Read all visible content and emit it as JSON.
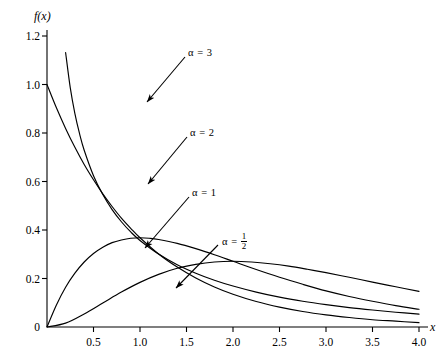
{
  "chart_data": {
    "type": "line",
    "title": "",
    "xlabel": "x",
    "ylabel": "f(x)",
    "xlim": [
      0,
      4.15
    ],
    "ylim": [
      0,
      1.26
    ],
    "grid": false,
    "legend_position": "inline-annotations",
    "x_ticks": [
      "0.5",
      "1.0",
      "1.5",
      "2.0",
      "2.5",
      "3.0",
      "3.5",
      "4.0"
    ],
    "x_tick_values": [
      0.5,
      1.0,
      1.5,
      2.0,
      2.5,
      3.0,
      3.5,
      4.0
    ],
    "y_ticks": [
      "0",
      "0.2",
      "0.4",
      "0.6",
      "0.8",
      "1.0",
      "1.2"
    ],
    "y_tick_values": [
      0,
      0.2,
      0.4,
      0.6,
      0.8,
      1.0,
      1.2
    ],
    "origin_label": "0",
    "series": [
      {
        "name": "alpha-one-half",
        "label_prefix": "α =",
        "label_value": "1/2",
        "alpha": 0.5,
        "formula": "f(x) = x^(-1/2) e^(-x) / sqrt(pi)",
        "peak": {
          "x": 0.0,
          "y": null
        },
        "points": [
          [
            0.02,
            3.974
          ],
          [
            0.04,
            2.765
          ],
          [
            0.06,
            2.227
          ],
          [
            0.08,
            1.907
          ],
          [
            0.1,
            1.687
          ],
          [
            0.13,
            1.461
          ],
          [
            0.16,
            1.297
          ],
          [
            0.2,
            1.132
          ],
          [
            0.25,
            0.987
          ],
          [
            0.3,
            0.88
          ],
          [
            0.35,
            0.797
          ],
          [
            0.4,
            0.729
          ],
          [
            0.5,
            0.624
          ],
          [
            0.6,
            0.546
          ],
          [
            0.7,
            0.484
          ],
          [
            0.8,
            0.434
          ],
          [
            0.9,
            0.392
          ],
          [
            1.0,
            0.357
          ],
          [
            1.2,
            0.301
          ],
          [
            1.4,
            0.257
          ],
          [
            1.6,
            0.222
          ],
          [
            1.8,
            0.193
          ],
          [
            2.0,
            0.169
          ],
          [
            2.25,
            0.144
          ],
          [
            2.5,
            0.123
          ],
          [
            2.75,
            0.106
          ],
          [
            3.0,
            0.092
          ],
          [
            3.25,
            0.08
          ],
          [
            3.5,
            0.07
          ],
          [
            3.75,
            0.061
          ],
          [
            4.0,
            0.053
          ]
        ]
      },
      {
        "name": "alpha-1",
        "label_prefix": "α =",
        "label_value": "1",
        "alpha": 1,
        "formula": "f(x) = e^(-x)",
        "peak": {
          "x": 0.0,
          "y": 1.0
        },
        "points": [
          [
            0.0,
            1.0
          ],
          [
            0.1,
            0.905
          ],
          [
            0.2,
            0.819
          ],
          [
            0.3,
            0.741
          ],
          [
            0.4,
            0.67
          ],
          [
            0.5,
            0.607
          ],
          [
            0.6,
            0.549
          ],
          [
            0.7,
            0.497
          ],
          [
            0.8,
            0.449
          ],
          [
            0.9,
            0.407
          ],
          [
            1.0,
            0.368
          ],
          [
            1.2,
            0.301
          ],
          [
            1.4,
            0.247
          ],
          [
            1.6,
            0.202
          ],
          [
            1.8,
            0.165
          ],
          [
            2.0,
            0.135
          ],
          [
            2.25,
            0.105
          ],
          [
            2.5,
            0.082
          ],
          [
            2.75,
            0.064
          ],
          [
            3.0,
            0.05
          ],
          [
            3.25,
            0.039
          ],
          [
            3.5,
            0.03
          ],
          [
            3.75,
            0.024
          ],
          [
            4.0,
            0.018
          ]
        ]
      },
      {
        "name": "alpha-2",
        "label_prefix": "α =",
        "label_value": "2",
        "alpha": 2,
        "formula": "f(x) = x e^(-x)",
        "peak": {
          "x": 1.0,
          "y": 0.368
        },
        "points": [
          [
            0.0,
            0.0
          ],
          [
            0.1,
            0.09
          ],
          [
            0.2,
            0.164
          ],
          [
            0.3,
            0.222
          ],
          [
            0.4,
            0.268
          ],
          [
            0.5,
            0.303
          ],
          [
            0.6,
            0.329
          ],
          [
            0.7,
            0.348
          ],
          [
            0.8,
            0.359
          ],
          [
            0.9,
            0.366
          ],
          [
            1.0,
            0.368
          ],
          [
            1.1,
            0.366
          ],
          [
            1.2,
            0.361
          ],
          [
            1.4,
            0.345
          ],
          [
            1.6,
            0.323
          ],
          [
            1.8,
            0.298
          ],
          [
            2.0,
            0.271
          ],
          [
            2.25,
            0.237
          ],
          [
            2.5,
            0.205
          ],
          [
            2.75,
            0.176
          ],
          [
            3.0,
            0.149
          ],
          [
            3.25,
            0.126
          ],
          [
            3.5,
            0.106
          ],
          [
            3.75,
            0.088
          ],
          [
            4.0,
            0.073
          ]
        ]
      },
      {
        "name": "alpha-3",
        "label_prefix": "α =",
        "label_value": "3",
        "alpha": 3,
        "formula": "f(x) = x^2 e^(-x) / 2",
        "peak": {
          "x": 2.0,
          "y": 0.271
        },
        "points": [
          [
            0.0,
            0.0
          ],
          [
            0.2,
            0.016
          ],
          [
            0.4,
            0.054
          ],
          [
            0.6,
            0.099
          ],
          [
            0.8,
            0.144
          ],
          [
            1.0,
            0.184
          ],
          [
            1.2,
            0.217
          ],
          [
            1.4,
            0.242
          ],
          [
            1.6,
            0.258
          ],
          [
            1.8,
            0.268
          ],
          [
            2.0,
            0.271
          ],
          [
            2.2,
            0.268
          ],
          [
            2.4,
            0.261
          ],
          [
            2.6,
            0.251
          ],
          [
            2.8,
            0.238
          ],
          [
            3.0,
            0.224
          ],
          [
            3.25,
            0.205
          ],
          [
            3.5,
            0.185
          ],
          [
            3.75,
            0.166
          ],
          [
            4.0,
            0.147
          ]
        ]
      }
    ],
    "annotations": [
      {
        "name": "alpha-3-annotation",
        "text_prefix": "α =",
        "text_value": "3",
        "fraction": false,
        "label_x": 188,
        "label_y": 47,
        "arrow_from_x": 185,
        "arrow_from_y": 57,
        "arrow_to_x": 147,
        "arrow_to_y": 102
      },
      {
        "name": "alpha-2-annotation",
        "text_prefix": "α =",
        "text_value": "2",
        "fraction": false,
        "label_x": 190,
        "label_y": 127,
        "arrow_from_x": 187,
        "arrow_from_y": 137,
        "arrow_to_x": 148,
        "arrow_to_y": 184
      },
      {
        "name": "alpha-1-annotation",
        "text_prefix": "α =",
        "text_value": "1",
        "fraction": false,
        "label_x": 192,
        "label_y": 187,
        "arrow_from_x": 189,
        "arrow_from_y": 197,
        "arrow_to_x": 145,
        "arrow_to_y": 248
      },
      {
        "name": "alpha-half-annotation",
        "text_prefix": "α =",
        "text_numerator": "1",
        "text_denominator": "2",
        "fraction": true,
        "label_x": 222,
        "label_y": 233,
        "arrow_from_x": 218,
        "arrow_from_y": 245,
        "arrow_to_x": 176,
        "arrow_to_y": 288
      }
    ]
  }
}
